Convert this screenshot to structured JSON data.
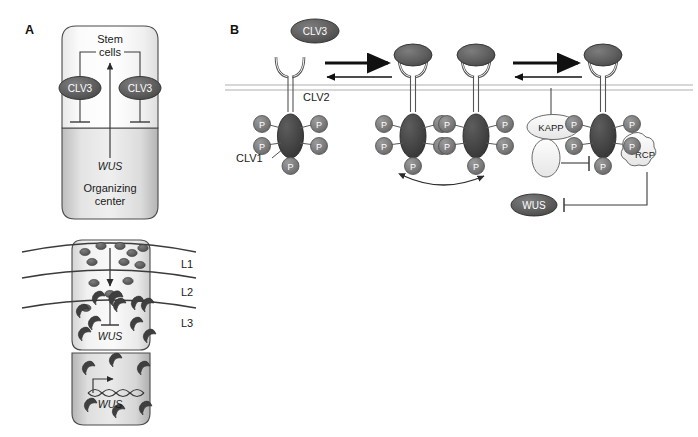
{
  "figure": {
    "panels": [
      {
        "id": "A",
        "label": "A"
      },
      {
        "id": "B",
        "label": "B"
      }
    ]
  },
  "panel_a": {
    "label": "A",
    "top_diagram": {
      "stem_cell_niche_label_line1": "Stem",
      "stem_cell_niche_label_line2": "cells",
      "organizing_center_label_line1": "Organizing",
      "organizing_center_label_line2": "center",
      "wus_label": "WUS",
      "clv3_left_label": "CLV3",
      "clv3_right_label": "CLV3"
    },
    "bottom_diagram": {
      "layer_labels": [
        "L1",
        "L2",
        "L3"
      ],
      "wus_inhibited_label": "WUS",
      "wus_gene_label": "WUS"
    }
  },
  "panel_b": {
    "label": "B",
    "ligand_label": "CLV3",
    "receptor_clv2_label": "CLV2",
    "kinase_clv1_label": "CLV1",
    "phosphate_label": "P",
    "phosphatase_label": "KAPP",
    "rcp_label": "RCP",
    "wus_label": "WUS",
    "states": [
      {
        "index": 1,
        "ligand_bound": false,
        "phosphates": 5
      },
      {
        "index": 2,
        "ligand_bound": true,
        "phosphates": 5
      },
      {
        "index": 3,
        "ligand_bound": true,
        "phosphates": 5
      },
      {
        "index": 4,
        "ligand_bound": true,
        "phosphates": 5
      }
    ]
  },
  "colors": {
    "protein_dark": "#4a4a4a",
    "protein_mid": "#6e6e6e",
    "phosphate": "#7a7a7a",
    "outline": "#3b3b3b",
    "membrane": "#9a9a9a",
    "cell_fill_light": "#f2f2f2",
    "cell_fill_mid": "#d8d8d8",
    "arrow_black": "#111111",
    "kapp_fill": "#f0f0f0"
  }
}
